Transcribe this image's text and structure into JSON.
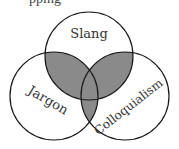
{
  "diagram": {
    "type": "venn",
    "title_partial": "pping",
    "fill_color": "#8a8a8a",
    "stroke_color": "#1a1a1a",
    "background": "#ffffff",
    "sets": [
      {
        "label": "Slang",
        "cx": 89,
        "cy": 56,
        "r": 44
      },
      {
        "label": "Jargon",
        "cx": 54,
        "cy": 96,
        "r": 44
      },
      {
        "label": "Colloquialism",
        "cx": 125,
        "cy": 96,
        "r": 44
      }
    ],
    "shaded_regions": [
      "Slang∩Jargon",
      "Slang∩Colloquialism",
      "Jargon∩Colloquialism"
    ]
  }
}
